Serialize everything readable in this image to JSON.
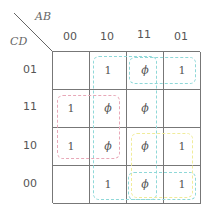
{
  "kmap": {
    "row_var": "CD",
    "col_var": "AB",
    "col_headers": [
      "00",
      "10",
      "11",
      "01"
    ],
    "row_headers": [
      "01",
      "11",
      "10",
      "00"
    ],
    "cells": [
      [
        "",
        "1",
        "ϕ",
        "1"
      ],
      [
        "1",
        "ϕ",
        "ϕ",
        ""
      ],
      [
        "1",
        "ϕ",
        "ϕ",
        "1"
      ],
      [
        "",
        "1",
        "ϕ",
        "1"
      ]
    ],
    "groups": [
      {
        "name": "group-cols-10-11-all-rows",
        "color": "#8fd8d8",
        "left": 93,
        "top": 56,
        "width": 64,
        "height": 144
      },
      {
        "name": "group-row01-cols-11-01",
        "color": "#8fd8d8",
        "left": 129,
        "top": 57,
        "width": 67,
        "height": 27
      },
      {
        "name": "group-rows-11-10-cols-00-10",
        "color": "#e8a8b8",
        "left": 57,
        "top": 95,
        "width": 63,
        "height": 64
      },
      {
        "name": "group-rows-10-00-cols-11-01",
        "color": "#f0ec9a",
        "left": 131,
        "top": 133,
        "width": 62,
        "height": 65
      },
      {
        "name": "group-row00-cols-11-01",
        "color": "#8fd8d8",
        "left": 128,
        "top": 172,
        "width": 68,
        "height": 28
      }
    ]
  }
}
